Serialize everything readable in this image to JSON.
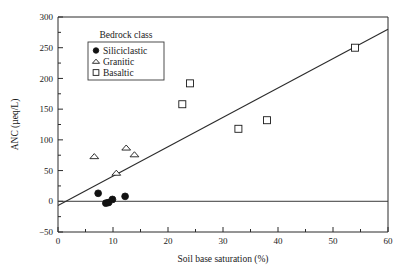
{
  "chart_data": {
    "type": "scatter",
    "title": "",
    "xlabel": "Soil base saturation (%)",
    "ylabel": "ANC (µeq/L)",
    "xlim": [
      0,
      60
    ],
    "ylim": [
      -50,
      300
    ],
    "xticks": [
      0,
      10,
      20,
      30,
      40,
      50,
      60
    ],
    "yticks": [
      -50,
      0,
      50,
      100,
      150,
      200,
      250,
      300
    ],
    "xtick_labels": [
      "0",
      "10",
      "20",
      "30",
      "40",
      "50",
      "60"
    ],
    "ytick_labels": [
      "−50",
      "0",
      "50",
      "100",
      "150",
      "200",
      "250",
      "300"
    ],
    "minor_ticks": true,
    "grid": false,
    "legend": {
      "title": "Bedrock class",
      "position": "upper-left",
      "entries": [
        {
          "label": "Siliciclastic",
          "marker": "filled-circle"
        },
        {
          "label": "Granitic",
          "marker": "open-triangle"
        },
        {
          "label": "Basaltic",
          "marker": "open-square"
        }
      ]
    },
    "series": [
      {
        "name": "Siliciclastic",
        "marker": "filled-circle",
        "points": [
          {
            "x": 7.3,
            "y": 13
          },
          {
            "x": 8.7,
            "y": -3
          },
          {
            "x": 9.2,
            "y": -2
          },
          {
            "x": 9.9,
            "y": 3
          },
          {
            "x": 12.2,
            "y": 8
          }
        ]
      },
      {
        "name": "Granitic",
        "marker": "open-triangle",
        "points": [
          {
            "x": 6.6,
            "y": 73
          },
          {
            "x": 10.6,
            "y": 46
          },
          {
            "x": 12.4,
            "y": 87
          },
          {
            "x": 13.9,
            "y": 76
          }
        ]
      },
      {
        "name": "Basaltic",
        "marker": "open-square",
        "points": [
          {
            "x": 22.6,
            "y": 158
          },
          {
            "x": 24.0,
            "y": 192
          },
          {
            "x": 32.8,
            "y": 118
          },
          {
            "x": 38.0,
            "y": 132
          },
          {
            "x": 54.0,
            "y": 250
          }
        ]
      }
    ],
    "fit_line": {
      "type": "linear-regression",
      "x_start": 0,
      "y_start": -7,
      "x_end": 60,
      "y_end": 280
    },
    "reference_line": {
      "axis": "y",
      "value": 0
    }
  }
}
